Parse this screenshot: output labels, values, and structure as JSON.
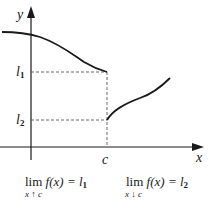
{
  "axes": {
    "y_label": "y",
    "x_label": "x",
    "c_label": "c"
  },
  "levels": {
    "l1": {
      "base": "l",
      "sub": "1"
    },
    "l2": {
      "base": "l",
      "sub": "2"
    }
  },
  "limits": {
    "left": {
      "word": "lim",
      "expr": "f(x) = l",
      "sub": "1",
      "under": "x ↑ c"
    },
    "right": {
      "word": "lim",
      "expr": "f(x) = l",
      "sub": "2",
      "under": "x ↓ c"
    }
  },
  "colors": {
    "ink": "#1a1a1a",
    "dash": "#555555"
  }
}
